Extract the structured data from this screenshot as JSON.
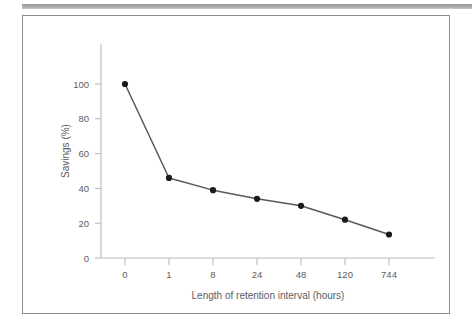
{
  "figure": {
    "border_color": "#8d8d93",
    "background": "#ffffff",
    "top_rule_color": "#9a9a9a"
  },
  "chart_data": {
    "type": "line",
    "title": "",
    "xlabel": "Length of retention interval (hours)",
    "ylabel": "Savings (%)",
    "categories": [
      "0",
      "1",
      "8",
      "24",
      "48",
      "120",
      "744"
    ],
    "values": [
      100,
      46,
      39,
      34,
      30,
      22,
      13.5
    ],
    "series": [
      {
        "name": "Savings",
        "values": [
          100,
          46,
          39,
          34,
          30,
          22,
          13.5
        ],
        "line_color": "#58585c",
        "marker_color": "#1b1b1f"
      }
    ],
    "ylim": [
      0,
      100
    ],
    "yticks": [
      "0",
      "20",
      "40",
      "60",
      "80",
      "100"
    ],
    "ytick_values": [
      0,
      20,
      40,
      60,
      80,
      100
    ],
    "xticks": [
      "0",
      "1",
      "8",
      "24",
      "48",
      "120",
      "744"
    ],
    "grid": false,
    "legend": "none",
    "axis_color": "#b9b9bd",
    "label_color": "#5c5c60"
  }
}
